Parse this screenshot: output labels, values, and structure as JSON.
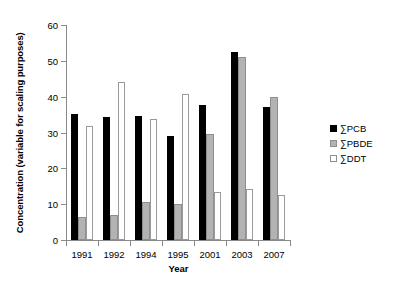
{
  "chart_data": {
    "type": "bar",
    "title": "",
    "xlabel": "Year",
    "ylabel": "Concentration (variable for scaling purposes)",
    "categories": [
      "1991",
      "1992",
      "1994",
      "1995",
      "2001",
      "2003",
      "2007"
    ],
    "series": [
      {
        "name": "∑PCB",
        "color": "#000000",
        "values": [
          35.3,
          34.2,
          34.5,
          29.0,
          37.8,
          52.6,
          37.0
        ]
      },
      {
        "name": "∑PBDE",
        "color": "#b3b3b3",
        "values": [
          6.5,
          7.0,
          10.5,
          10.0,
          29.5,
          51.2,
          39.8
        ]
      },
      {
        "name": "∑DDT",
        "color": "#ffffff",
        "values": [
          31.8,
          44.0,
          33.8,
          40.8,
          13.4,
          14.3,
          12.5
        ]
      }
    ],
    "ylim": [
      0,
      60
    ],
    "yticks": [
      0,
      10,
      20,
      30,
      40,
      50,
      60
    ],
    "ytick_labels": [
      "0",
      "10",
      "20",
      "30",
      "40",
      "50",
      "60"
    ],
    "grid": false,
    "legend_position": "right"
  },
  "legend": {
    "items": [
      {
        "label": "∑PCB"
      },
      {
        "label": "∑PBDE"
      },
      {
        "label": "∑DDT"
      }
    ]
  }
}
